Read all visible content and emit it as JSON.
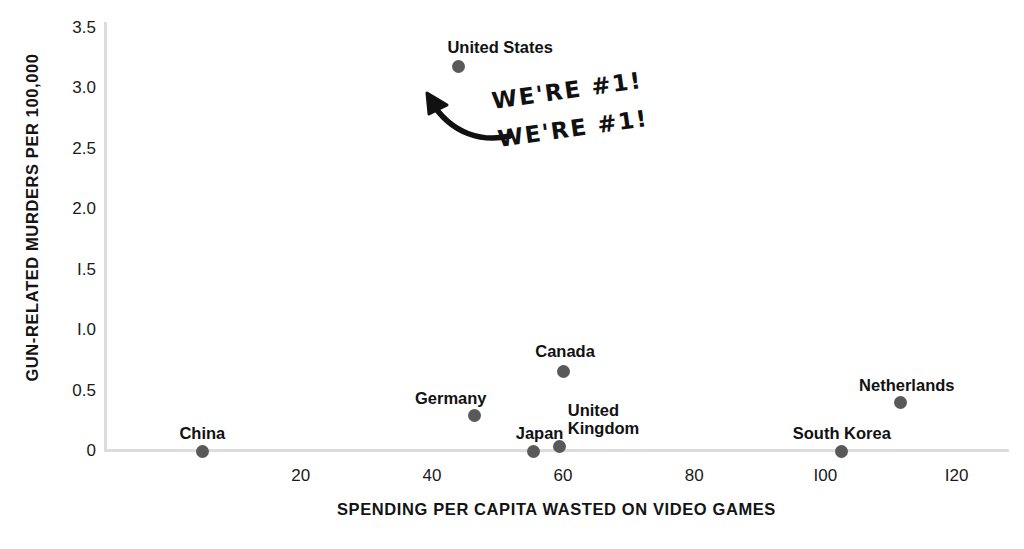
{
  "chart_data": {
    "type": "scatter",
    "title": "",
    "xlabel": "SPENDING PER CAPITA WASTED ON VIDEO GAMES",
    "ylabel": "GUN-RELATED MURDERS PER 100,000",
    "xlim": [
      -10,
      128
    ],
    "ylim": [
      0,
      3.5
    ],
    "xticks": [
      20,
      40,
      60,
      80,
      100,
      120
    ],
    "xtick_labels": [
      "20",
      "40",
      "60",
      "80",
      "I00",
      "I20"
    ],
    "yticks": [
      0,
      0.5,
      1.0,
      1.5,
      2.0,
      2.5,
      3.0,
      3.5
    ],
    "ytick_labels": [
      "0",
      "0.5",
      "I.0",
      "I.5",
      "2.0",
      "2.5",
      "3.0",
      "3.5"
    ],
    "grid": false,
    "legend": false,
    "marker_color": "#595959",
    "axis_color": "#dcdcdc",
    "points": [
      {
        "label": "China",
        "x": 5,
        "y": 0,
        "label_align": "center",
        "label_dx": 0,
        "label_dy": -26
      },
      {
        "label": "Germany",
        "x": 46.5,
        "y": 0.29,
        "label_align": "right",
        "label_dx": 12,
        "label_dy": -26
      },
      {
        "label": "Japan",
        "x": 55.5,
        "y": 0,
        "label_align": "center",
        "label_dx": 6,
        "label_dy": -26
      },
      {
        "label": "Canada",
        "x": 60,
        "y": 0.66,
        "label_align": "center",
        "label_dx": 2,
        "label_dy": -28
      },
      {
        "label": "United\nKingdom",
        "x": 59.5,
        "y": 0.04,
        "label_align": "left",
        "label_dx": 8,
        "label_dy": -44
      },
      {
        "label": "South Korea",
        "x": 102.5,
        "y": 0,
        "label_align": "center",
        "label_dx": 0,
        "label_dy": -26
      },
      {
        "label": "Netherlands",
        "x": 111.5,
        "y": 0.4,
        "label_align": "center",
        "label_dx": 6,
        "label_dy": -26
      },
      {
        "label": "United States",
        "x": 44,
        "y": 3.18,
        "label_align": "center",
        "label_dx": 42,
        "label_dy": -28
      }
    ]
  },
  "annotation": {
    "line1": "WE'RE #1!",
    "line2": "WE'RE #1!",
    "arrow": "curved-arrow-up-left"
  }
}
